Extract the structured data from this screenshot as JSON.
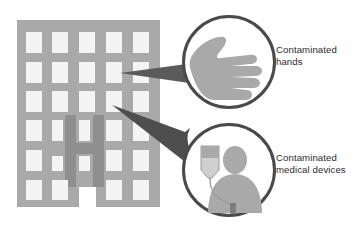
{
  "diagram": {
    "background_color": "#ffffff",
    "building": {
      "name": "hospital-building",
      "fill": "#a9a9a9",
      "window_fill": "#f4f4f4",
      "accent_fill": "#8f8f8f",
      "accent_shape": "H",
      "window_columns": 5,
      "window_rows": 6,
      "x": 17,
      "y": 20,
      "width": 143,
      "height": 187
    },
    "arrows": [
      {
        "name": "arrow-to-hands",
        "fill": "#5a5a5a",
        "from": "contaminated-hands-circle",
        "to": "hospital-building",
        "points": "194,62 120,73 196,82"
      },
      {
        "name": "arrow-to-devices",
        "fill": "#4e4e4e",
        "from": "contaminated-devices-circle",
        "to": "hospital-building",
        "points": "186,130 112,105 214,173"
      }
    ],
    "nodes": [
      {
        "name": "contaminated-hands",
        "icon": "hand-icon",
        "circle": {
          "cx": 229,
          "cy": 62,
          "r": 46,
          "stroke": "#4a4a4a",
          "stroke_width": 3,
          "fill": "#ffffff"
        },
        "icon_fill": "#a9a9a9",
        "label_lines": [
          "Contaminated",
          "hands"
        ]
      },
      {
        "name": "contaminated-medical-devices",
        "icon": "iv-drip-patient-icon",
        "circle": {
          "cx": 229,
          "cy": 170,
          "r": 46,
          "stroke": "#4a4a4a",
          "stroke_width": 3,
          "fill": "#ffffff"
        },
        "icon_fill": "#a9a9a9",
        "iv_bag_fill": "#c9c9c9",
        "iv_bag_top_fill": "#a9a9a9",
        "label_lines": [
          "Contaminated",
          "medical devices"
        ]
      }
    ],
    "labels": {
      "hands_line1": "Contaminated",
      "hands_line2": "hands",
      "devices_line1": "Contaminated",
      "devices_line2": "medical devices"
    },
    "colors": {
      "building_gray": "#a9a9a9",
      "window_white": "#f4f4f4",
      "accent_gray": "#8f8f8f",
      "arrow_dark": "#545454",
      "circle_stroke": "#4a4a4a",
      "icon_gray": "#a9a9a9",
      "text": "#2b2b2b"
    }
  }
}
